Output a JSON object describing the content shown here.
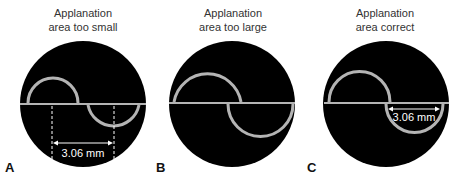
{
  "panels": [
    {
      "letter": "A",
      "title_line1": "Applanation",
      "title_line2": "area too small",
      "measurement": "3.06 mm"
    },
    {
      "letter": "B",
      "title_line1": "Applanation",
      "title_line2": "area too large"
    },
    {
      "letter": "C",
      "title_line1": "Applanation",
      "title_line2": "area correct",
      "measurement": "3.06 mm"
    }
  ],
  "colors": {
    "disc": "#000000",
    "mire": "#b4b4b4",
    "text": "#333333"
  }
}
